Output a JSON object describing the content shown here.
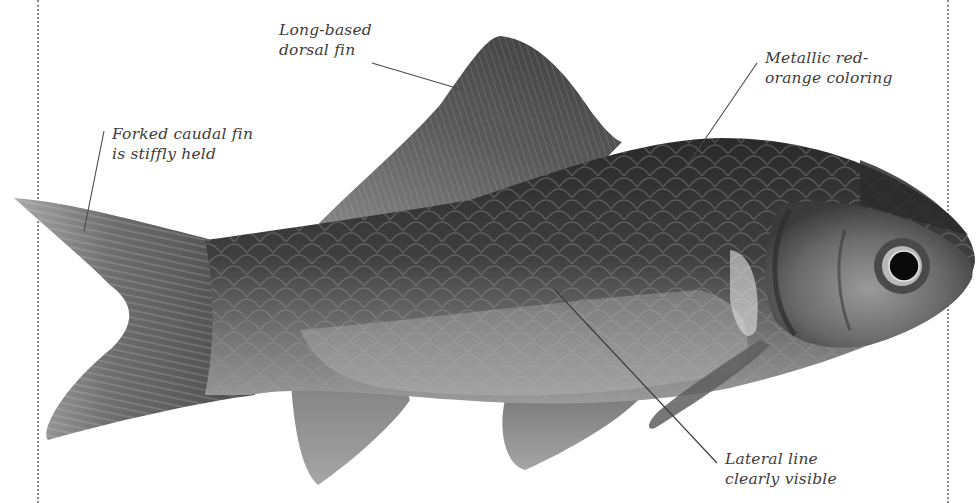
{
  "figure": {
    "colors": {
      "background": "#ffffff",
      "label_text": "#3c3c3c",
      "leader_line": "#4a4a4a",
      "margin_rule": "#8a8a8a",
      "body_dark": "#2e2e2e",
      "body_mid": "#6a6a6a",
      "belly_light": "#bdbdbd",
      "fin": "#8c8c8c"
    }
  },
  "callouts": [
    {
      "id": "dorsal",
      "lines": [
        "Long-based",
        "dorsal fin"
      ]
    },
    {
      "id": "coloring",
      "lines": [
        "Metallic red-",
        "orange coloring"
      ]
    },
    {
      "id": "caudal",
      "lines": [
        "Forked caudal fin",
        "is stiffly held"
      ]
    },
    {
      "id": "lateral",
      "lines": [
        "Lateral line",
        "clearly visible"
      ]
    }
  ]
}
